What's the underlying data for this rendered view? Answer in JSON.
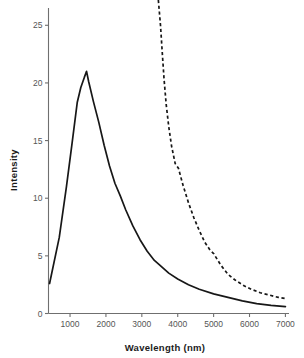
{
  "chart_data": {
    "type": "line",
    "title": "",
    "xlabel": "Wavelength (nm)",
    "ylabel": "Intensity",
    "xlim": [
      400,
      7100
    ],
    "ylim": [
      0,
      26.5
    ],
    "grid": false,
    "legend": "none",
    "xticks": [
      1000,
      2000,
      3000,
      4000,
      5000,
      6000,
      7000
    ],
    "xtick_labels": [
      "1000",
      "2000",
      "3000",
      "4000",
      "5000",
      "6000",
      "7000"
    ],
    "yticks": [
      0,
      5,
      10,
      15,
      20,
      25
    ],
    "ytick_labels": [
      "0",
      "5",
      "10",
      "15",
      "20",
      "25"
    ],
    "series": [
      {
        "name": "solid-emission-curve",
        "style": "solid",
        "color": "#171717",
        "points": [
          [
            430,
            2.6
          ],
          [
            700,
            6.6
          ],
          [
            900,
            11.0
          ],
          [
            1050,
            14.6
          ],
          [
            1200,
            18.3
          ],
          [
            1300,
            19.6
          ],
          [
            1400,
            20.5
          ],
          [
            1460,
            21.0
          ],
          [
            1520,
            20.1
          ],
          [
            1650,
            18.4
          ],
          [
            1800,
            16.6
          ],
          [
            1950,
            14.6
          ],
          [
            2100,
            12.8
          ],
          [
            2250,
            11.3
          ],
          [
            2400,
            10.2
          ],
          [
            2550,
            9.0
          ],
          [
            2750,
            7.6
          ],
          [
            2950,
            6.4
          ],
          [
            3150,
            5.4
          ],
          [
            3350,
            4.6
          ],
          [
            3500,
            4.2
          ],
          [
            3750,
            3.5
          ],
          [
            4000,
            3.0
          ],
          [
            4300,
            2.5
          ],
          [
            4600,
            2.1
          ],
          [
            5000,
            1.7
          ],
          [
            5400,
            1.4
          ],
          [
            5800,
            1.1
          ],
          [
            6200,
            0.85
          ],
          [
            6600,
            0.7
          ],
          [
            7000,
            0.6
          ]
        ]
      },
      {
        "name": "dashed-absorption-curve",
        "style": "dashed",
        "color": "#171717",
        "points": [
          [
            3460,
            27.2
          ],
          [
            3520,
            25.0
          ],
          [
            3570,
            22.6
          ],
          [
            3620,
            20.3
          ],
          [
            3680,
            18.1
          ],
          [
            3750,
            16.2
          ],
          [
            3830,
            14.5
          ],
          [
            3930,
            13.0
          ],
          [
            4020,
            12.6
          ],
          [
            4150,
            11.1
          ],
          [
            4300,
            9.6
          ],
          [
            4450,
            8.3
          ],
          [
            4600,
            7.2
          ],
          [
            4750,
            6.2
          ],
          [
            4900,
            5.5
          ],
          [
            5000,
            5.2
          ],
          [
            5200,
            4.2
          ],
          [
            5400,
            3.4
          ],
          [
            5600,
            2.9
          ],
          [
            5850,
            2.4
          ],
          [
            6050,
            2.1
          ],
          [
            6300,
            1.8
          ],
          [
            6550,
            1.6
          ],
          [
            6800,
            1.4
          ],
          [
            7000,
            1.3
          ]
        ]
      }
    ]
  }
}
